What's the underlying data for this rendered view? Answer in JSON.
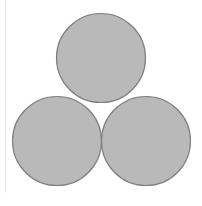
{
  "figure": {
    "type": "venn3",
    "background_color": "#ffffff",
    "frame": {
      "rule_color": "#e9e9e9",
      "rule_x": 5,
      "rule_top": 0,
      "rule_height": 193
    }
  },
  "style": {
    "circle_fill": "#b9b9b9",
    "circle_stroke": "#808080",
    "stroke_width": 1.2,
    "pair_intersection_fill": "#f8f8f6",
    "triple_intersection_fill": "#b9b9b9",
    "label_color": "#000000"
  },
  "chart_data": {
    "type": "venn",
    "xlabel": "",
    "ylabel": "",
    "radius": 44.5,
    "circles": [
      {
        "id": "A",
        "label": "",
        "cx": 101,
        "cy": 58,
        "r": 44.5,
        "fill": "#b9b9b9",
        "stroke": "#808080",
        "position": "top"
      },
      {
        "id": "B",
        "label": "",
        "cx": 57,
        "cy": 141,
        "r": 44.5,
        "fill": "#b9b9b9",
        "stroke": "#808080",
        "position": "bottom-left"
      },
      {
        "id": "C",
        "label": "",
        "cx": 146,
        "cy": 141,
        "r": 44.5,
        "fill": "#b9b9b9",
        "stroke": "#808080",
        "position": "bottom-right"
      }
    ],
    "regions": [
      {
        "id": "A-only",
        "sets": [
          "A"
        ],
        "shading": "gray",
        "fill": "#b9b9b9",
        "label": ""
      },
      {
        "id": "B-only",
        "sets": [
          "B"
        ],
        "shading": "gray",
        "fill": "#b9b9b9",
        "label": ""
      },
      {
        "id": "C-only",
        "sets": [
          "C"
        ],
        "shading": "gray",
        "fill": "#b9b9b9",
        "label": ""
      },
      {
        "id": "AB",
        "sets": [
          "A",
          "B"
        ],
        "shading": "white",
        "fill": "#f8f8f6",
        "label": ""
      },
      {
        "id": "AC",
        "sets": [
          "A",
          "C"
        ],
        "shading": "white",
        "fill": "#f8f8f6",
        "label": ""
      },
      {
        "id": "BC",
        "sets": [
          "B",
          "C"
        ],
        "shading": "white",
        "fill": "#f8f8f6",
        "label": ""
      },
      {
        "id": "ABC",
        "sets": [
          "A",
          "B",
          "C"
        ],
        "shading": "gray",
        "fill": "#b9b9b9",
        "label": ""
      }
    ],
    "legend": {
      "visible": false,
      "entries": []
    },
    "grid": false,
    "annotations": []
  }
}
